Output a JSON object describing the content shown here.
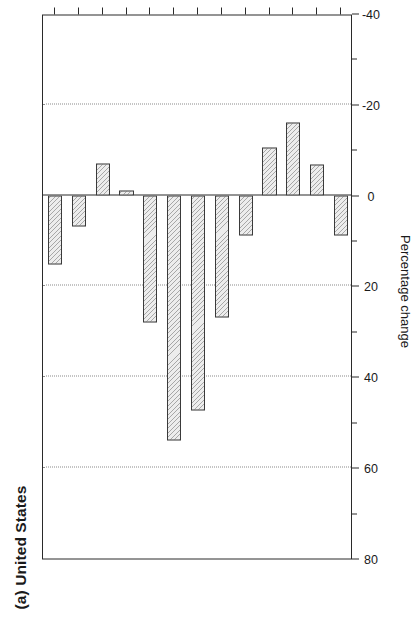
{
  "panel": {
    "label": "(a) United States"
  },
  "chart_data": {
    "type": "bar",
    "orientation": "vertical",
    "title": "(a) United States",
    "xlabel": "Age group",
    "ylabel": "Percentage change",
    "categories": [
      "15-19",
      "20-24",
      "25-29",
      "30-34",
      "35-39",
      "40-44",
      "45-49",
      "50-54",
      "55-59",
      "60-64",
      "65-69",
      "70-74",
      "75+"
    ],
    "values": [
      9,
      -6.7,
      -16,
      -10.6,
      9,
      27,
      47.5,
      54,
      28,
      -1,
      -7,
      7,
      15.3
    ],
    "series": [
      {
        "name": "Percentage change",
        "values": [
          9,
          -6.7,
          -16,
          -10.6,
          9,
          27,
          47.5,
          54,
          28,
          -1,
          -7,
          7,
          15.3
        ]
      }
    ],
    "ylim": [
      -40,
      80
    ],
    "yticks": [
      80,
      60,
      40,
      20,
      0,
      -20,
      -40
    ],
    "yticklabels": [
      "80",
      "60",
      "40",
      "20",
      "0",
      "-20",
      "-40"
    ],
    "minor_yticks": [
      70,
      50,
      30,
      10,
      -10,
      -30
    ],
    "gridlines": [
      60,
      40,
      20,
      -20
    ],
    "grid": true,
    "zero_reference": 0,
    "legend": null,
    "bar_fill": "#ededed",
    "bar_edge": "#3a3a3a",
    "grid_color": "#8a8a8a",
    "axis_color": "#2a2a2a"
  }
}
